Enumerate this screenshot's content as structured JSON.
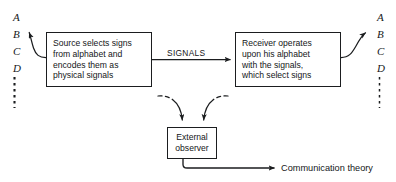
{
  "diagram": {
    "background_color": "#ffffff",
    "stroke_color": "#1b1d1f",
    "text_color": "#141618",
    "alphabet_left": {
      "letters": [
        "A",
        "B",
        "C",
        "D"
      ],
      "continuation": "vertical-dotted-line"
    },
    "alphabet_right": {
      "letters": [
        "A",
        "B",
        "C",
        "D"
      ],
      "continuation": "vertical-dotted-line"
    },
    "boxes": {
      "source": {
        "lines": [
          "Source selects signs",
          "from alphabet and",
          "encodes them as",
          "physical signals"
        ]
      },
      "receiver": {
        "lines": [
          "Receiver operates",
          "upon his alphabet",
          "with the signals,",
          "which select signs"
        ]
      },
      "observer": {
        "lines": [
          "External",
          "observer"
        ]
      }
    },
    "labels": {
      "signals": "SIGNALS",
      "communication_theory": "Communication theory"
    },
    "connectors": [
      {
        "name": "source-to-left-alphabet",
        "style": "solid-curved",
        "arrowhead": "left-alphabet"
      },
      {
        "name": "source-to-receiver",
        "style": "solid-straight",
        "arrowhead": "receiver",
        "label": "SIGNALS"
      },
      {
        "name": "receiver-to-right-alphabet",
        "style": "solid-curved",
        "arrowhead": "right-alphabet"
      },
      {
        "name": "source-to-observer",
        "style": "dashed-then-solid-curved",
        "arrowhead": "observer"
      },
      {
        "name": "receiver-to-observer",
        "style": "dashed-then-solid-curved",
        "arrowhead": "observer"
      },
      {
        "name": "observer-to-communication-theory",
        "style": "solid-elbow",
        "arrowhead": "communication-theory"
      }
    ]
  }
}
